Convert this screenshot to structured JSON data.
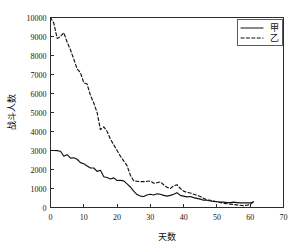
{
  "chart_data": {
    "type": "line",
    "title": "",
    "xlabel": "天数",
    "ylabel": "战斗人数",
    "xlim": [
      0,
      70
    ],
    "ylim": [
      0,
      10000
    ],
    "xticks": [
      0,
      10,
      20,
      30,
      40,
      50,
      60,
      70
    ],
    "yticks": [
      0,
      1000,
      2000,
      3000,
      4000,
      5000,
      6000,
      7000,
      8000,
      9000,
      10000
    ],
    "xticklabels": [
      "0",
      "10",
      "20",
      "30",
      "40",
      "50",
      "60",
      "70"
    ],
    "yticklabels": [
      "0",
      "1000",
      "2000",
      "3000",
      "4000",
      "5000",
      "6000",
      "7000",
      "8000",
      "9000",
      "10000"
    ],
    "grid": false,
    "legend_position": "upper right",
    "line_color": "#111111",
    "series": [
      {
        "name": "甲",
        "style": "solid",
        "x": [
          0,
          1,
          2,
          3,
          4,
          5,
          6,
          7,
          8,
          9,
          10,
          11,
          12,
          13,
          14,
          15,
          16,
          17,
          18,
          19,
          20,
          21,
          22,
          23,
          24,
          25,
          26,
          27,
          28,
          29,
          30,
          31,
          32,
          33,
          34,
          35,
          36,
          37,
          38,
          39,
          40,
          41,
          42,
          43,
          44,
          45,
          46,
          47,
          48,
          49,
          50,
          51,
          52,
          53,
          54,
          55,
          56,
          57,
          58,
          59,
          60,
          61
        ],
        "values": [
          3000,
          3000,
          2990,
          2960,
          2700,
          2780,
          2600,
          2620,
          2540,
          2360,
          2300,
          2190,
          2080,
          2080,
          1900,
          1960,
          1620,
          1580,
          1500,
          1560,
          1420,
          1430,
          1400,
          1240,
          1080,
          860,
          680,
          600,
          580,
          660,
          700,
          660,
          720,
          700,
          640,
          600,
          640,
          700,
          780,
          640,
          600,
          560,
          580,
          520,
          480,
          440,
          380,
          380,
          340,
          320,
          300,
          280,
          280,
          260,
          260,
          280,
          260,
          240,
          240,
          240,
          240,
          300
        ]
      },
      {
        "name": "乙",
        "style": "dashed",
        "x": [
          0,
          1,
          2,
          3,
          4,
          5,
          6,
          7,
          8,
          9,
          10,
          11,
          12,
          13,
          14,
          15,
          16,
          17,
          18,
          19,
          20,
          21,
          22,
          23,
          24,
          25,
          26,
          27,
          28,
          29,
          30,
          31,
          32,
          33,
          34,
          35,
          36,
          37,
          38,
          39,
          40,
          41,
          42,
          43,
          44,
          45,
          46,
          47,
          48,
          49,
          50,
          51,
          52,
          53,
          54,
          55,
          56,
          57,
          58,
          59,
          60,
          61
        ],
        "values": [
          10000,
          9700,
          8900,
          9000,
          9200,
          8700,
          8300,
          7800,
          7300,
          7100,
          6560,
          6500,
          5900,
          5500,
          5000,
          4100,
          4250,
          4000,
          3600,
          3300,
          3000,
          2700,
          2450,
          2200,
          1700,
          1400,
          1380,
          1360,
          1360,
          1380,
          1400,
          1280,
          1300,
          1350,
          1200,
          1060,
          1000,
          1140,
          1200,
          1000,
          860,
          800,
          760,
          700,
          640,
          580,
          480,
          400,
          380,
          340,
          300,
          260,
          220,
          200,
          180,
          160,
          140,
          120,
          100,
          120,
          160,
          300
        ]
      }
    ]
  },
  "legend": {
    "entries": [
      {
        "label": "甲",
        "style": "solid"
      },
      {
        "label": "乙",
        "style": "dashed"
      }
    ]
  }
}
